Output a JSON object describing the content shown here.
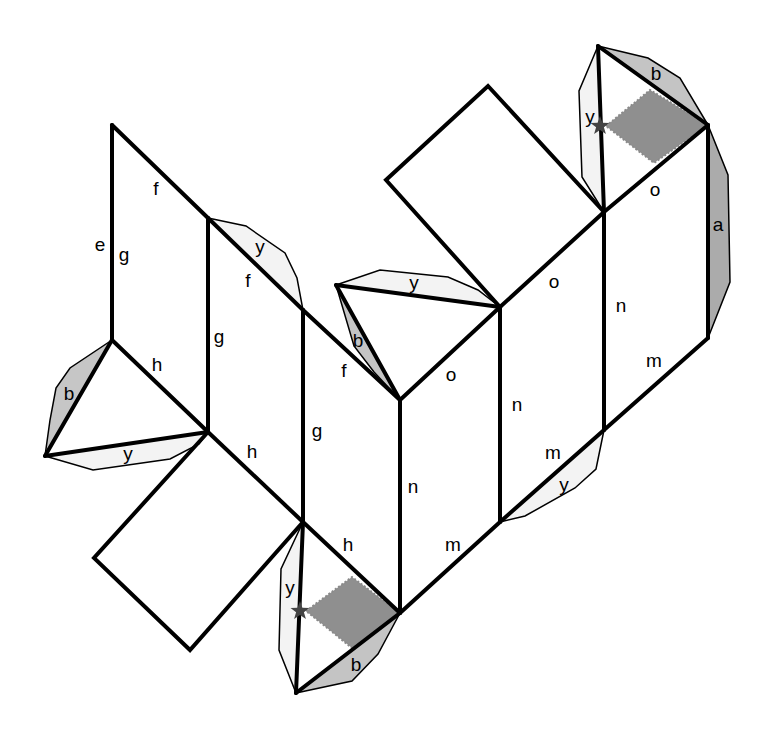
{
  "diagram": {
    "type": "polyhedron-net",
    "colors": {
      "edge": "#000000",
      "tab_light": "#f2f2f2",
      "tab_dark": "#c4c4c4",
      "tab_darker": "#a8a8a8",
      "shaded_region": "#8f8f8f",
      "star": "#444444"
    },
    "edge_labels": [
      {
        "text": "f",
        "x": 156,
        "y": 190
      },
      {
        "text": "e",
        "x": 100,
        "y": 246
      },
      {
        "text": "g",
        "x": 124,
        "y": 256
      },
      {
        "text": "y",
        "x": 260,
        "y": 248
      },
      {
        "text": "f",
        "x": 248,
        "y": 282
      },
      {
        "text": "g",
        "x": 219,
        "y": 338
      },
      {
        "text": "h",
        "x": 157,
        "y": 366
      },
      {
        "text": "b",
        "x": 69,
        "y": 395
      },
      {
        "text": "y",
        "x": 128,
        "y": 455
      },
      {
        "text": "h",
        "x": 252,
        "y": 453
      },
      {
        "text": "g",
        "x": 317,
        "y": 432
      },
      {
        "text": "f",
        "x": 344,
        "y": 372
      },
      {
        "text": "b",
        "x": 358,
        "y": 342
      },
      {
        "text": "y",
        "x": 414,
        "y": 284
      },
      {
        "text": "o",
        "x": 451,
        "y": 376
      },
      {
        "text": "n",
        "x": 413,
        "y": 488
      },
      {
        "text": "n",
        "x": 517,
        "y": 406
      },
      {
        "text": "o",
        "x": 554,
        "y": 283
      },
      {
        "text": "n",
        "x": 621,
        "y": 307
      },
      {
        "text": "m",
        "x": 654,
        "y": 362
      },
      {
        "text": "a",
        "x": 718,
        "y": 226
      },
      {
        "text": "o",
        "x": 655,
        "y": 191
      },
      {
        "text": "b",
        "x": 656,
        "y": 75
      },
      {
        "text": "y",
        "x": 590,
        "y": 118
      },
      {
        "text": "m",
        "x": 553,
        "y": 454
      },
      {
        "text": "y",
        "x": 564,
        "y": 486
      },
      {
        "text": "h",
        "x": 348,
        "y": 546
      },
      {
        "text": "m",
        "x": 453,
        "y": 546
      },
      {
        "text": "y",
        "x": 290,
        "y": 589
      },
      {
        "text": "b",
        "x": 356,
        "y": 666
      }
    ],
    "markers": [
      {
        "type": "star",
        "x": 600,
        "y": 126
      },
      {
        "type": "star",
        "x": 300,
        "y": 611
      }
    ]
  }
}
